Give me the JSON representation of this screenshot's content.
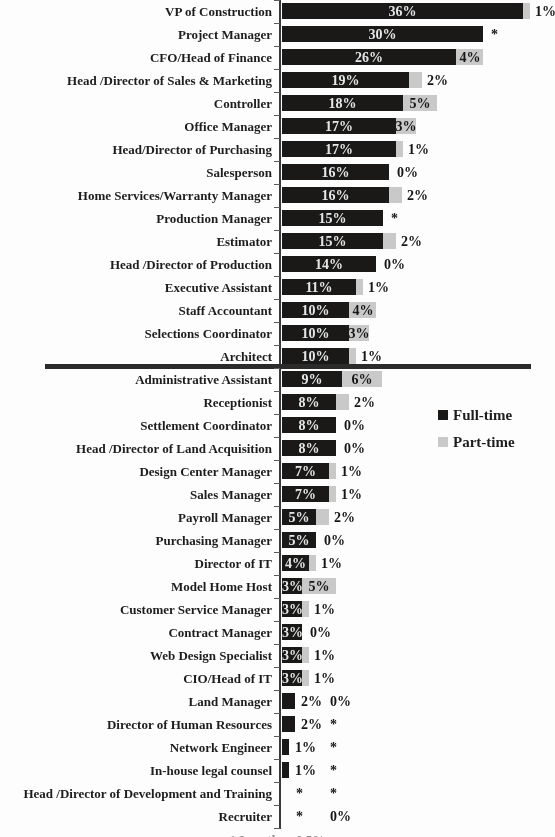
{
  "chart_data": {
    "type": "bar",
    "orientation": "horizontal",
    "stacked": true,
    "title": "",
    "xlabel": "",
    "ylabel": "",
    "value_unit": "percent",
    "xlim": [
      0,
      40
    ],
    "grid": false,
    "legend_position": "right-middle",
    "divider_note": "thick horizontal rule separates positions above 10% full-time from those below",
    "asterisk_label": "*",
    "footnote_clipped": "* Less than 0.5%",
    "categories": [
      "VP of Construction",
      "Project Manager",
      "CFO/Head of Finance",
      "Head /Director of Sales & Marketing",
      "Controller",
      "Office Manager",
      "Head/Director of Purchasing",
      "Salesperson",
      "Home Services/Warranty Manager",
      "Production Manager",
      "Estimator",
      "Head /Director of Production",
      "Executive Assistant",
      "Staff Accountant",
      "Selections Coordinator",
      "Architect",
      "Administrative Assistant",
      "Receptionist",
      "Settlement Coordinator",
      "Head /Director of Land Acquisition",
      "Design Center Manager",
      "Sales Manager",
      "Payroll Manager",
      "Purchasing Manager",
      "Director of IT",
      "Model Home Host",
      "Customer Service Manager",
      "Contract Manager",
      "Web Design Specialist",
      "CIO/Head of IT",
      "Land Manager",
      "Director of Human Resources",
      "Network Engineer",
      "In-house legal counsel",
      "Head /Director of Development and Training",
      "Recruiter"
    ],
    "series": [
      {
        "name": "Full-time",
        "color": "#1b1818",
        "values": [
          36,
          30,
          26,
          19,
          18,
          17,
          17,
          16,
          16,
          15,
          15,
          14,
          11,
          10,
          10,
          10,
          9,
          8,
          8,
          8,
          7,
          7,
          5,
          5,
          4,
          3,
          3,
          3,
          3,
          3,
          2,
          2,
          1,
          1,
          0,
          0
        ],
        "labels": [
          "36%",
          "30%",
          "26%",
          "19%",
          "18%",
          "17%",
          "17%",
          "16%",
          "16%",
          "15%",
          "15%",
          "14%",
          "11%",
          "10%",
          "10%",
          "10%",
          "9%",
          "8%",
          "8%",
          "8%",
          "7%",
          "7%",
          "5%",
          "5%",
          "4%",
          "3%",
          "3%",
          "3%",
          "3%",
          "3%",
          "2%",
          "2%",
          "1%",
          "1%",
          "*",
          "*"
        ]
      },
      {
        "name": "Part-time",
        "color": "#c9c9c9",
        "values": [
          1,
          0,
          4,
          2,
          5,
          3,
          1,
          0,
          2,
          0,
          2,
          0,
          1,
          4,
          3,
          1,
          6,
          2,
          0,
          0,
          1,
          1,
          2,
          0,
          1,
          5,
          1,
          0,
          1,
          1,
          0,
          0,
          0,
          0,
          0,
          0
        ],
        "labels": [
          "1%",
          "*",
          "4%",
          "2%",
          "5%",
          "3%",
          "1%",
          "0%",
          "2%",
          "*",
          "2%",
          "0%",
          "1%",
          "4%",
          "3%",
          "1%",
          "6%",
          "2%",
          "0%",
          "0%",
          "1%",
          "1%",
          "2%",
          "0%",
          "1%",
          "5%",
          "1%",
          "0%",
          "1%",
          "1%",
          "0%",
          "*",
          "*",
          "*",
          "*",
          "0%"
        ]
      }
    ]
  },
  "legend": {
    "full_time": "Full-time",
    "part_time": "Part-time"
  }
}
